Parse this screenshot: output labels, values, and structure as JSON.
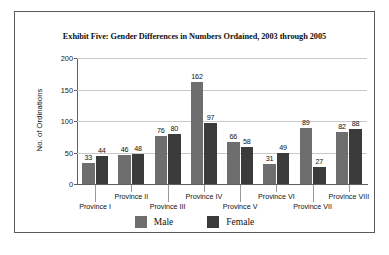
{
  "chart_data": {
    "type": "bar",
    "title": "Exhibit Five: Gender Differences in Numbers Ordained, 2003 through 2005",
    "xlabel": "",
    "ylabel": "No. of Ordinations",
    "categories": [
      "Province I",
      "Province II",
      "Province III",
      "Province IV",
      "Province V",
      "Province VI",
      "Province VII",
      "Province VIII"
    ],
    "series": [
      {
        "name": "Male",
        "color": "#6e6e6e",
        "values": [
          33,
          46,
          76,
          162,
          66,
          31,
          89,
          82
        ]
      },
      {
        "name": "Female",
        "color": "#3b3b3b",
        "values": [
          44,
          48,
          80,
          97,
          58,
          49,
          27,
          88
        ]
      }
    ],
    "ylim": [
      0,
      200
    ],
    "yticks": [
      0,
      50,
      100,
      150,
      200
    ],
    "ytick_labels": [
      "0",
      "50",
      "100",
      "150",
      "200"
    ],
    "grid": "horizontal",
    "legend_position": "bottom"
  },
  "legend": {
    "items": [
      {
        "label": "Male"
      },
      {
        "label": "Female"
      }
    ]
  }
}
